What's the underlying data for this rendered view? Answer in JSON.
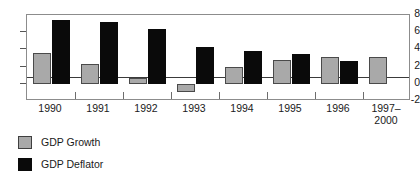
{
  "chart_data": {
    "type": "bar",
    "title": "",
    "subtitle": "",
    "xlabel": "",
    "ylabel": "",
    "ylim": [
      -2,
      8
    ],
    "yticks": [
      -2,
      0,
      2,
      4,
      6,
      8
    ],
    "ytick_labels": [
      "-2",
      "0",
      "2",
      "4",
      "6",
      "8"
    ],
    "grid": false,
    "legend_position": "bottom-left",
    "categories": [
      "1990",
      "1991",
      "1992",
      "1993",
      "1994",
      "1995",
      "1996",
      "1997-2000"
    ],
    "category_labels": [
      {
        "line1": "1990",
        "line2": ""
      },
      {
        "line1": "1991",
        "line2": ""
      },
      {
        "line1": "1992",
        "line2": ""
      },
      {
        "line1": "1993",
        "line2": ""
      },
      {
        "line1": "1994",
        "line2": ""
      },
      {
        "line1": "1995",
        "line2": ""
      },
      {
        "line1": "1996",
        "line2": ""
      },
      {
        "line1": "1997–",
        "line2": "2000"
      }
    ],
    "series": [
      {
        "name": "GDP Growth",
        "color": "#a9a9a9",
        "values": [
          3.6,
          2.3,
          0.7,
          -1.0,
          1.9,
          2.8,
          3.1,
          3.1
        ]
      },
      {
        "name": "GDP Deflator",
        "color": "#0a0a0a",
        "values": [
          7.4,
          7.2,
          6.4,
          4.3,
          3.8,
          3.5,
          2.7,
          null
        ]
      }
    ]
  },
  "legend": {
    "items": [
      {
        "label": "GDP Growth",
        "color": "#a9a9a9"
      },
      {
        "label": "GDP Deflator",
        "color": "#0a0a0a"
      }
    ]
  }
}
